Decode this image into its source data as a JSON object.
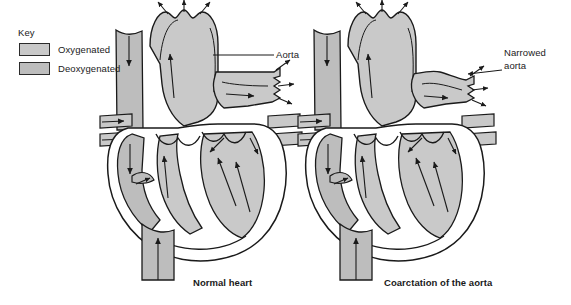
{
  "figure": {
    "type": "anatomical-diagram",
    "background_color": "#ffffff",
    "line_color": "#1a1a1a",
    "oxygenated_color": "#c9c9c9",
    "deoxygenated_color": "#bdbdbd"
  },
  "key": {
    "title": "Key",
    "items": [
      {
        "label": "Oxygenated",
        "color": "#c9c9c9"
      },
      {
        "label": "Deoxygenated",
        "color": "#bdbdbd"
      }
    ]
  },
  "panels": [
    {
      "id": "normal-heart",
      "caption": "Normal heart",
      "annotation": "Aorta",
      "annotation_lines": [
        "Aorta"
      ]
    },
    {
      "id": "coarctation-heart",
      "caption": "Coarctation of the aorta",
      "annotation": "Narrowed aorta",
      "annotation_lines": [
        "Narrowed",
        "aorta"
      ]
    }
  ],
  "captions": {
    "left": "Normal heart",
    "right": "Coarctation of the aorta"
  },
  "annotations": {
    "aorta": "Aorta",
    "narrowed_line1": "Narrowed",
    "narrowed_line2": "aorta"
  }
}
